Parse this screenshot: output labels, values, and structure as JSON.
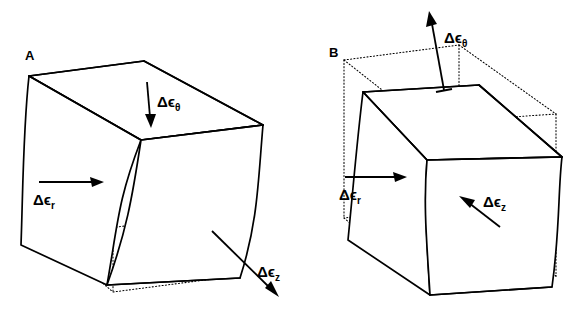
{
  "figure": {
    "background_color": "#ffffff",
    "line_color": "#000000",
    "width": 584,
    "height": 318
  },
  "panels": [
    {
      "id": "A",
      "letter": "A",
      "description": "Element bulging outward: radial extension with circumferential and axial contraction",
      "labels": {
        "radial": "Δϵ",
        "radial_sub": "r",
        "circumferential": "Δϵ",
        "circumferential_sub": "θ",
        "axial": "Δϵ",
        "axial_sub": "z"
      },
      "arrows": [
        {
          "name": "radial",
          "direction": "right",
          "sense": "outward"
        },
        {
          "name": "circumferential",
          "direction": "down",
          "sense": "inward"
        },
        {
          "name": "axial",
          "direction": "down-right",
          "sense": "outward"
        }
      ]
    },
    {
      "id": "B",
      "letter": "B",
      "description": "Element displaced up-left: radial extension with circumferential and axial expansion reversed",
      "labels": {
        "radial": "Δϵ",
        "radial_sub": "r",
        "circumferential": "Δϵ",
        "circumferential_sub": "θ",
        "axial": "Δϵ",
        "axial_sub": "z"
      },
      "arrows": [
        {
          "name": "radial",
          "direction": "right",
          "sense": "outward"
        },
        {
          "name": "circumferential",
          "direction": "up-left",
          "sense": "outward"
        },
        {
          "name": "axial",
          "direction": "up-left",
          "sense": "inward"
        }
      ]
    }
  ],
  "legend": {
    "symbols": [
      {
        "name": "solid-outline",
        "meaning": "deformed element"
      },
      {
        "name": "dotted-outline",
        "meaning": "undeformed reference element"
      }
    ]
  }
}
